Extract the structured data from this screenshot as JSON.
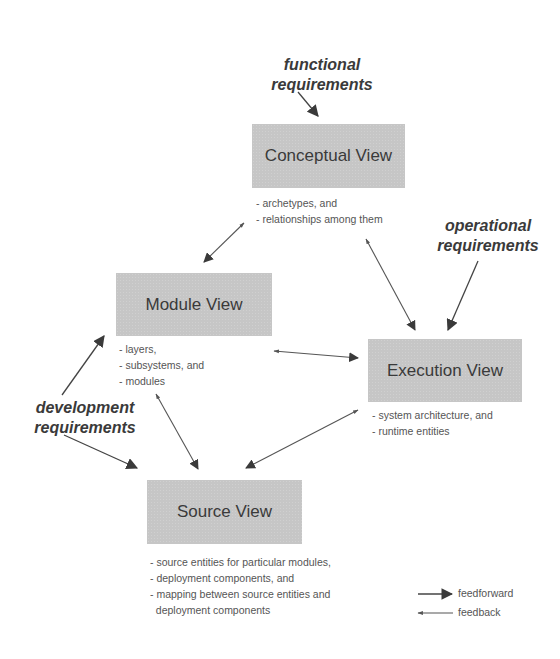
{
  "diagram": {
    "views": {
      "conceptual": {
        "title": "Conceptual View",
        "notes": [
          "- archetypes, and",
          "- relationships among them"
        ]
      },
      "module": {
        "title": "Module View",
        "notes": [
          "- layers,",
          "- subsystems, and",
          "- modules"
        ]
      },
      "execution": {
        "title": "Execution View",
        "notes": [
          "- system architecture, and",
          "- runtime entities"
        ]
      },
      "source": {
        "title": "Source View",
        "notes": [
          "- source entities for particular modules,",
          "- deployment components, and",
          "- mapping between source entities and",
          "  deployment components"
        ]
      }
    },
    "requirements": {
      "functional": [
        "functional",
        "requirements"
      ],
      "operational": [
        "operational",
        "requirements"
      ],
      "development": [
        "development",
        "requirements"
      ]
    },
    "legend": {
      "feedforward": "feedforward",
      "feedback": "feedback"
    },
    "colors": {
      "box_fill": "#c6c6c6",
      "arrow": "#444444"
    }
  }
}
